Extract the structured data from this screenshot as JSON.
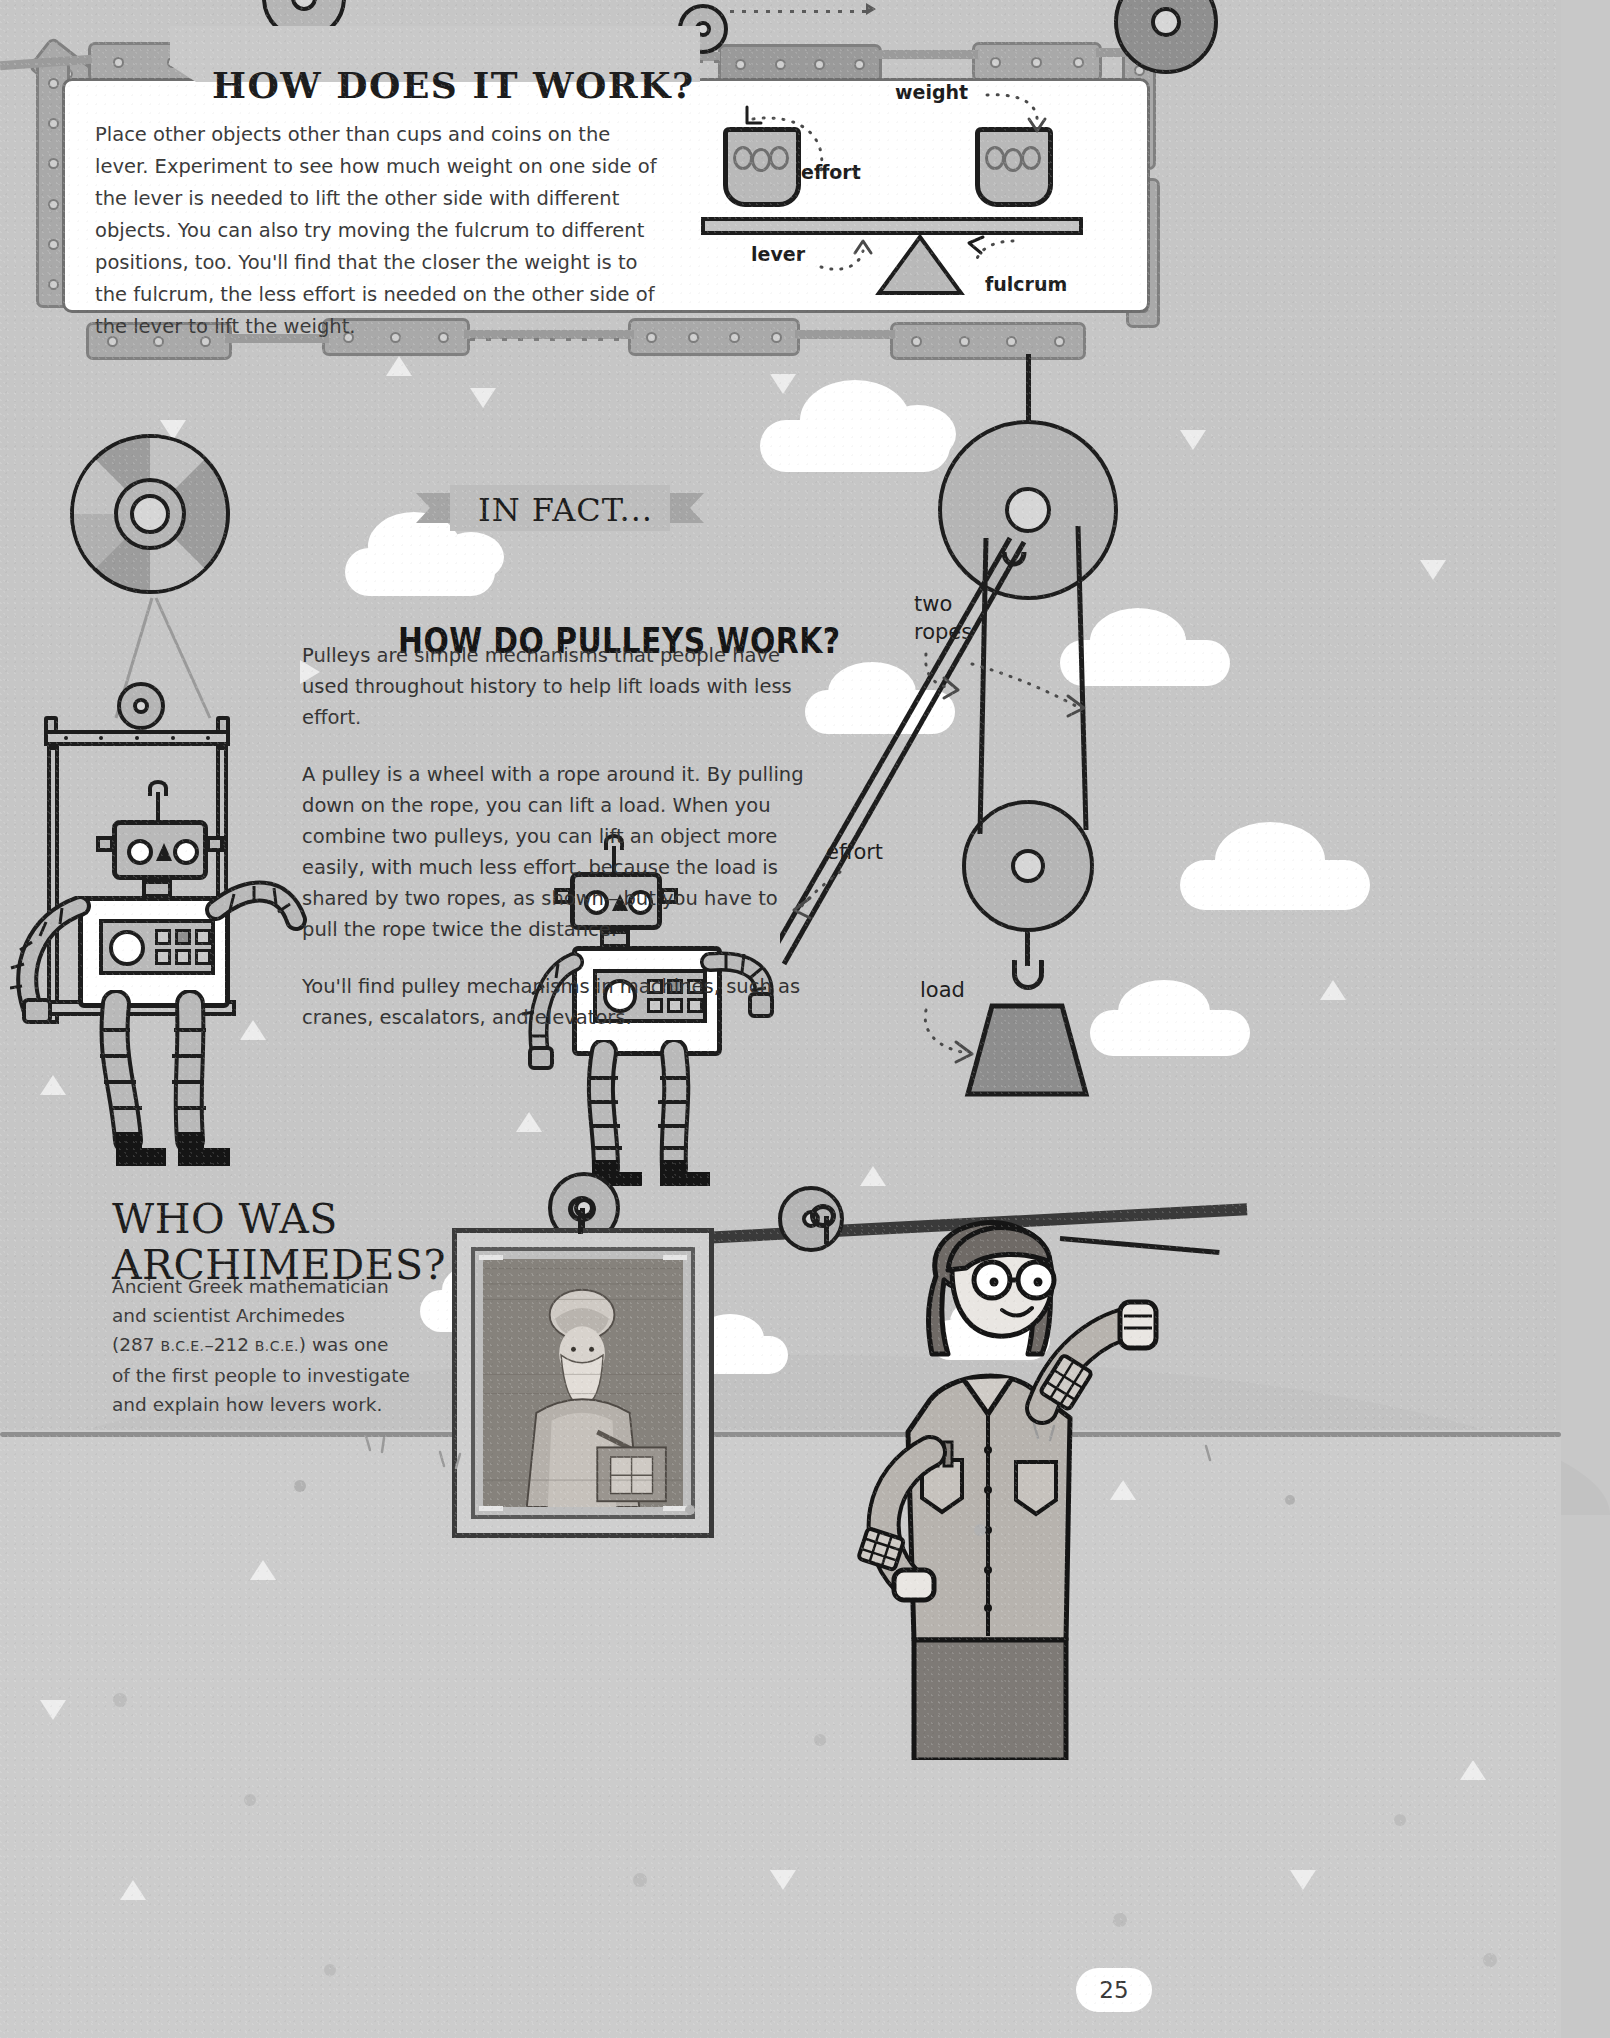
{
  "page": {
    "number": "25",
    "background_color": "#c8c8c8"
  },
  "how_it_works": {
    "title": "HOW DOES IT WORK?",
    "body": "Place other objects other than cups and coins on the lever. Experiment to see how much weight on one side of the lever is needed to lift the other side with different objects. You can also try moving the fulcrum to different positions, too. You'll find that the closer the weight is to the fulcrum, the less effort is needed on the other side of the lever to lift the weight."
  },
  "lever_diagram": {
    "labels": {
      "weight": "weight",
      "effort": "effort",
      "lever": "lever",
      "fulcrum": "fulcrum"
    }
  },
  "in_fact": {
    "banner": "IN FACT..."
  },
  "pulleys": {
    "title": "HOW DO PULLEYS WORK?",
    "paragraphs": [
      "Pulleys are simple mechanisms that people have used throughout history to help lift loads with less effort.",
      "A pulley is a wheel with a rope around it. By pulling down on the rope, you can lift a load. When you combine two pulleys, you can lift an object more easily, with much less effort, because the load is shared by two ropes, as shown—but you have to pull the rope twice the distance.",
      "You'll find pulley mechanisms in  machines, such as cranes, escalators, and elevators."
    ]
  },
  "pulley_diagram": {
    "labels": {
      "two_ropes_line1": "two",
      "two_ropes_line2": "ropes",
      "effort": "effort",
      "load": "load"
    }
  },
  "archimedes": {
    "title_line1": "WHO WAS",
    "title_line2": "ARCHIMEDES?",
    "body_line1": "Ancient Greek mathematician",
    "body_line2": "and scientist Archimedes",
    "body_line3_pre": "(287 ",
    "body_line3_sc1": "B.C.E.",
    "body_line3_mid": "–212 ",
    "body_line3_sc2": "B.C.E.",
    "body_line3_post": ") was one",
    "body_line4": "of the first people to investigate",
    "body_line5": "and explain how levers work."
  },
  "colors": {
    "ink": "#1d1d1d",
    "paper": "#ffffff",
    "page_bg": "#c8c8c8",
    "metal": "#a9a9a9",
    "metal_edge": "#808080",
    "text_gray": "#3a3a3a"
  }
}
